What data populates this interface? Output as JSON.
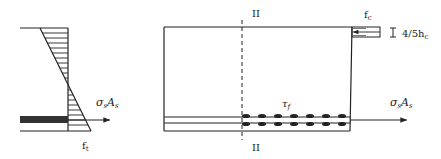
{
  "figure": {
    "left_panel": {
      "name": "section-stress-diagram",
      "labels": {
        "steel_force": "σsAs",
        "steel_force_sigma": "σ",
        "steel_force_sigma_sub": "s",
        "steel_force_A": "A",
        "steel_force_A_sub": "s",
        "tensile_strength": "f",
        "tensile_strength_sub": "t"
      }
    },
    "right_panel": {
      "name": "beam-bond-diagram",
      "labels": {
        "section_top": "II",
        "section_bottom": "II",
        "compressive_strength": "f",
        "compressive_strength_sub": "c",
        "compression_depth": "4/5h",
        "compression_depth_sub": "c",
        "bond_stress": "τ",
        "bond_stress_sub": "f",
        "steel_force_sigma": "σ",
        "steel_force_sigma_sub": "s",
        "steel_force_A": "A",
        "steel_force_A_sub": "s"
      },
      "bond_marker_count": 7
    },
    "colors": {
      "line": "#222222",
      "rebar_fill": "#333333",
      "background": "#ffffff"
    }
  }
}
